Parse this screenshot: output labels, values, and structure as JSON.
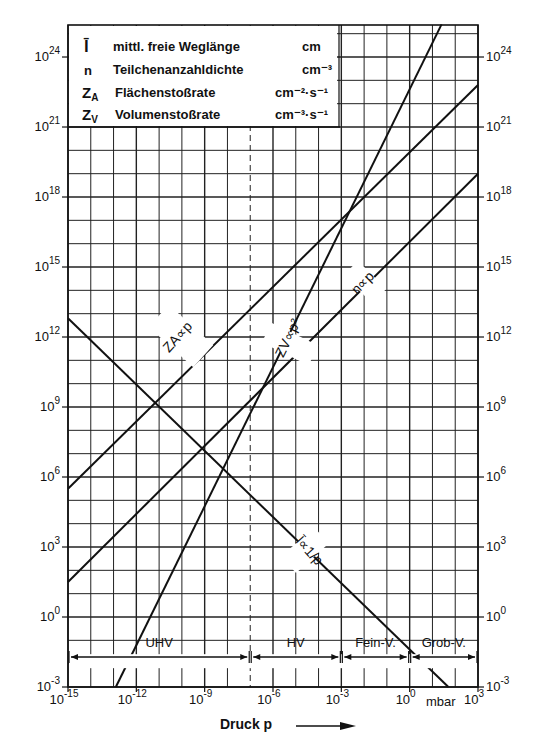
{
  "chart_data": {
    "type": "line",
    "title": "",
    "xlabel": "Druck p",
    "x_unit": "mbar",
    "ylabel": "",
    "xscale": "log",
    "yscale": "log",
    "xlim": [
      1e-15,
      1000.0
    ],
    "ylim": [
      0.001,
      2.5e+25
    ],
    "grid": true,
    "x_ticks": [
      "10^-15",
      "10^-12",
      "10^-9",
      "10^-6",
      "10^-3",
      "10^0",
      "10^3"
    ],
    "y_ticks": [
      "10^-3",
      "10^0",
      "10^3",
      "10^6",
      "10^9",
      "10^12",
      "10^15",
      "10^18",
      "10^21",
      "10^24"
    ],
    "legend": [
      {
        "symbol": "l̄",
        "name": "mittl. freie Weglänge",
        "unit": "cm"
      },
      {
        "symbol": "n",
        "name": "Teilchenanzahldichte",
        "unit": "cm^-3"
      },
      {
        "symbol": "Z_A",
        "name": "Flächenstoßrate",
        "unit": "cm^-2·s^-1"
      },
      {
        "symbol": "Z_V",
        "name": "Volumenstoßrate",
        "unit": "cm^-3·s^-1"
      }
    ],
    "series": [
      {
        "name": "l̄ ∝ 1/p",
        "log_x": [
          -15,
          1.7
        ],
        "log_y": [
          12.8,
          -3
        ]
      },
      {
        "name": "n ∝ p",
        "log_x": [
          -15,
          3
        ],
        "log_y": [
          1.5,
          19.0
        ]
      },
      {
        "name": "Z_A ∝ p",
        "log_x": [
          -15,
          3
        ],
        "log_y": [
          5.5,
          22.8
        ]
      },
      {
        "name": "Z_V ∝ p²",
        "log_x": [
          -12.9,
          1.4
        ],
        "log_y": [
          -3,
          25.4
        ]
      }
    ],
    "regions": [
      {
        "name": "UHV",
        "from": "10^-15",
        "to": "10^-7"
      },
      {
        "name": "HV",
        "from": "10^-7",
        "to": "10^-3"
      },
      {
        "name": "Fein-V.",
        "from": "10^-3",
        "to": "10^0"
      },
      {
        "name": "Grob-V.",
        "from": "10^0",
        "to": "10^3"
      }
    ],
    "region_boundary_dashed_at": "10^-7"
  },
  "legend": {
    "rows": [
      {
        "sym": "l̄",
        "name": "mittl. freie Weglänge",
        "unit": "cm"
      },
      {
        "sym": "n",
        "name": "Teilchenanzahldichte",
        "unit": "cm⁻³"
      },
      {
        "sym": "Z",
        "sub": "A",
        "name": "Flächenstoßrate",
        "unit": "cm⁻²·s⁻¹"
      },
      {
        "sym": "Z",
        "sub": "V",
        "name": "Volumenstoßrate",
        "unit": "cm⁻³·s⁻¹"
      }
    ]
  },
  "curve_labels": {
    "za": "ZA∝p",
    "zv": "ZV∝p²",
    "n": "n∝p",
    "l": "l̄∝1/p"
  },
  "regions": [
    "UHV",
    "HV",
    "Fein-V.",
    "Grob-V."
  ],
  "axis": {
    "x_title": "Druck  p",
    "x_unit": "mbar",
    "y_exponents": [
      "24",
      "21",
      "18",
      "15",
      "12",
      "9",
      "6",
      "3",
      "0",
      "-3"
    ],
    "x_exponents": [
      "-15",
      "-12",
      "-9",
      "-6",
      "-3",
      "0",
      "3"
    ]
  }
}
